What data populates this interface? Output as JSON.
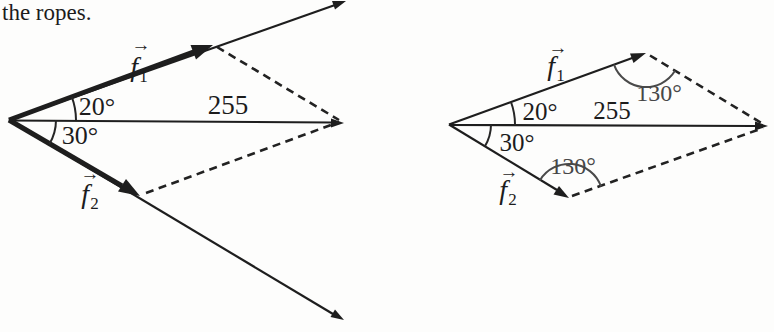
{
  "caption": "the ropes.",
  "colors": {
    "ink": "#1e1e1e",
    "muted": "#474747",
    "background": "#fdfdfc"
  },
  "left": {
    "f1": {
      "letter": "f",
      "sub": "1",
      "arrow": "→"
    },
    "f2": {
      "letter": "f",
      "sub": "2",
      "arrow": "→"
    },
    "angle_f1": "20°",
    "angle_f2": "30°",
    "resultant": "255"
  },
  "right": {
    "f1": {
      "letter": "f",
      "sub": "1",
      "arrow": "→"
    },
    "f2": {
      "letter": "f",
      "sub": "2",
      "arrow": "→"
    },
    "angle_f1": "20°",
    "angle_f2": "30°",
    "resultant": "255",
    "angle_top": "130°",
    "angle_bottom": "130°"
  }
}
